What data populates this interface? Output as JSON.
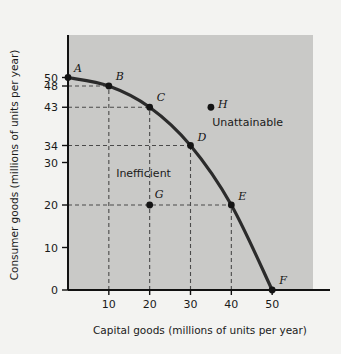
{
  "chart_data": {
    "type": "line",
    "title": "",
    "xlabel": "Capital goods (millions of units per year)",
    "ylabel": "Consumer goods (millions of units per year)",
    "xlim": [
      0,
      60
    ],
    "ylim": [
      0,
      60
    ],
    "xticks": [
      10,
      20,
      30,
      40,
      50
    ],
    "yticks": [
      0,
      10,
      20,
      30,
      34,
      43,
      48,
      50
    ],
    "grid": false,
    "legend": null,
    "series": [
      {
        "name": "Production possibilities frontier",
        "color": "#2b2b2b",
        "x": [
          0,
          10,
          20,
          30,
          40,
          50
        ],
        "values": [
          50,
          48,
          43,
          34,
          20,
          0
        ]
      }
    ],
    "points": [
      {
        "label": "A",
        "x": 0,
        "y": 50,
        "on_curve": true,
        "label_dx": 6,
        "label_dy": -6
      },
      {
        "label": "B",
        "x": 10,
        "y": 48,
        "on_curve": true,
        "label_dx": 7,
        "label_dy": -6
      },
      {
        "label": "C",
        "x": 20,
        "y": 43,
        "on_curve": true,
        "label_dx": 7,
        "label_dy": -6
      },
      {
        "label": "D",
        "x": 30,
        "y": 34,
        "on_curve": true,
        "label_dx": 7,
        "label_dy": -5
      },
      {
        "label": "E",
        "x": 40,
        "y": 20,
        "on_curve": true,
        "label_dx": 7,
        "label_dy": -5
      },
      {
        "label": "F",
        "x": 50,
        "y": 0,
        "on_curve": true,
        "label_dx": 7,
        "label_dy": -6
      },
      {
        "label": "G",
        "x": 20,
        "y": 20,
        "on_curve": false,
        "label_dx": 5,
        "label_dy": -7
      },
      {
        "label": "H",
        "x": 35,
        "y": 43,
        "on_curve": false,
        "label_dx": 7,
        "label_dy": 1
      }
    ],
    "annotations": [
      {
        "text": "Unattainable",
        "x": 44,
        "y": 38.5
      },
      {
        "text": "Inefficient",
        "x": 18.5,
        "y": 26.5
      }
    ],
    "guides": [
      {
        "from": "y-axis",
        "value": 48,
        "to_x": 10
      },
      {
        "from": "y-axis",
        "value": 43,
        "to_x": 20
      },
      {
        "from": "y-axis",
        "value": 34,
        "to_x": 30
      },
      {
        "from": "y-axis",
        "value": 20,
        "to_x": 40
      },
      {
        "from": "x-axis",
        "value": 10,
        "to_y": 48
      },
      {
        "from": "x-axis",
        "value": 20,
        "to_y": 43
      },
      {
        "from": "x-axis",
        "value": 30,
        "to_y": 34
      },
      {
        "from": "x-axis",
        "value": 40,
        "to_y": 20
      }
    ],
    "colors": {
      "plot_background": "#c9c9c7",
      "page_background": "#f3f3f1",
      "curve": "#2b2b2b",
      "axis": "#111111",
      "guide": "#4a4a4a",
      "text": "#1a1a1a"
    }
  },
  "axis": {
    "x_title": "Capital goods (millions of units per year)",
    "y_title": "Consumer goods (millions of units per year)",
    "x_tick_labels": [
      "10",
      "20",
      "30",
      "40",
      "50"
    ],
    "y_tick_labels": [
      "0",
      "10",
      "20",
      "30",
      "34",
      "43",
      "48",
      "50"
    ]
  },
  "labels": {
    "unattainable": "Unattainable",
    "inefficient": "Inefficient",
    "A": "A",
    "B": "B",
    "C": "C",
    "D": "D",
    "E": "E",
    "F": "F",
    "G": "G",
    "H": "H"
  }
}
